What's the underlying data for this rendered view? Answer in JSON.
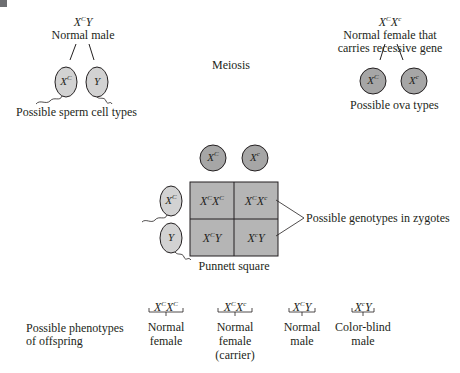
{
  "figure": {
    "process_label": "Meiosis",
    "colors": {
      "sperm_fill": "#d2d2d2",
      "ova_fill": "#a6a6a6",
      "punnett_fill": "#b5b5b5",
      "stroke": "#231f20"
    }
  },
  "father": {
    "genotype": {
      "base1": "X",
      "sup1": "C",
      "base2": "Y",
      "sup2": ""
    },
    "label": "Normal male",
    "gametes": [
      {
        "base": "X",
        "sup": "C"
      },
      {
        "base": "Y",
        "sup": ""
      }
    ],
    "gametes_label": "Possible sperm cell types"
  },
  "mother": {
    "genotype": {
      "base1": "X",
      "sup1": "C",
      "base2": "X",
      "sup2": "c"
    },
    "label_line1": "Normal female that",
    "label_line2": "carries recessive gene",
    "gametes": [
      {
        "base": "X",
        "sup": "C"
      },
      {
        "base": "X",
        "sup": "c"
      }
    ],
    "gametes_label": "Possible ova types"
  },
  "punnett": {
    "label": "Punnett square",
    "cols": [
      {
        "base": "X",
        "sup": "C"
      },
      {
        "base": "X",
        "sup": "c"
      }
    ],
    "rows": [
      {
        "base": "X",
        "sup": "C"
      },
      {
        "base": "Y",
        "sup": ""
      }
    ],
    "cells": [
      [
        {
          "b1": "X",
          "s1": "C",
          "b2": "X",
          "s2": "C"
        },
        {
          "b1": "X",
          "s1": "C",
          "b2": "X",
          "s2": "c"
        }
      ],
      [
        {
          "b1": "X",
          "s1": "C",
          "b2": "Y",
          "s2": ""
        },
        {
          "b1": "X",
          "s1": "c",
          "b2": "Y",
          "s2": ""
        }
      ]
    ],
    "callout": "Possible genotypes in zygotes"
  },
  "phenotypes": {
    "label_line1": "Possible phenotypes",
    "label_line2": "of offspring",
    "items": [
      {
        "b1": "X",
        "s1": "C",
        "b2": "X",
        "s2": "C",
        "line1": "Normal",
        "line2": "female",
        "line3": ""
      },
      {
        "b1": "X",
        "s1": "C",
        "b2": "X",
        "s2": "c",
        "line1": "Normal",
        "line2": "female",
        "line3": "(carrier)"
      },
      {
        "b1": "X",
        "s1": "C",
        "b2": "Y",
        "s2": "",
        "line1": "Normal",
        "line2": "male",
        "line3": ""
      },
      {
        "b1": "X",
        "s1": "c",
        "b2": "Y",
        "s2": "",
        "line1": "Color-blind",
        "line2": "male",
        "line3": ""
      }
    ]
  }
}
